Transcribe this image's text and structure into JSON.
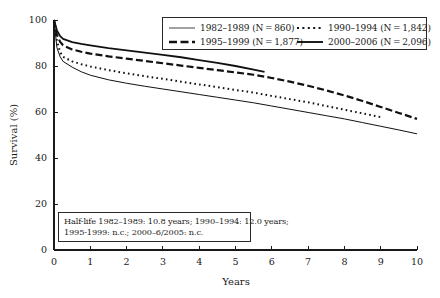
{
  "chart_data": {
    "type": "line",
    "title": "",
    "xlabel": "Years",
    "ylabel": "Survival (%)",
    "xlim": [
      0,
      10
    ],
    "ylim": [
      0,
      100
    ],
    "grid": false,
    "legend_position": "top-right",
    "x_ticks": [
      "0",
      "1",
      "2",
      "3",
      "4",
      "5",
      "6",
      "7",
      "8",
      "9",
      "10"
    ],
    "y_ticks": [
      "0",
      "20",
      "40",
      "60",
      "80",
      "100"
    ],
    "series": [
      {
        "name": "1982-1989 (N = 860)",
        "label": "1982–1989 (N = 860)",
        "style": "thin-solid",
        "color": "#555555",
        "x": [
          0,
          0.08,
          0.17,
          0.25,
          0.5,
          0.75,
          1,
          1.5,
          2,
          2.5,
          3,
          3.5,
          4,
          4.5,
          5,
          5.5,
          6,
          6.5,
          7,
          7.5,
          8,
          8.5,
          9,
          9.5,
          10
        ],
        "values": [
          100,
          88,
          84,
          82,
          79.5,
          77.5,
          76,
          74,
          72.5,
          71.2,
          70,
          68.8,
          67.6,
          66.4,
          65.2,
          64,
          62.6,
          61.2,
          59.8,
          58.4,
          57,
          55.4,
          53.8,
          52.2,
          50.5
        ]
      },
      {
        "name": "1990-1994 (N = 1,842)",
        "label": "1990–1994 (N = 1,842)",
        "style": "dotted",
        "color": "#111111",
        "x": [
          0,
          0.08,
          0.17,
          0.25,
          0.5,
          0.75,
          1,
          1.5,
          2,
          2.5,
          3,
          3.5,
          4,
          4.5,
          5,
          5.5,
          6,
          6.5,
          7,
          7.5,
          8,
          8.5,
          9
        ],
        "values": [
          100,
          91,
          86,
          84,
          82,
          80.8,
          79.8,
          78.2,
          76.8,
          75.6,
          74.4,
          73.2,
          72,
          70.8,
          69.6,
          68.4,
          67,
          65.6,
          64.2,
          62.6,
          61,
          59.4,
          57.8
        ]
      },
      {
        "name": "1995-1999 (N = 1,877)",
        "label": "1995–1999 (N = 1,877)",
        "style": "dashed",
        "color": "#111111",
        "x": [
          0,
          0.08,
          0.17,
          0.25,
          0.5,
          0.75,
          1,
          1.5,
          2,
          2.5,
          3,
          3.5,
          4,
          4.5,
          5,
          5.5,
          6,
          6.5,
          7,
          7.5,
          8,
          8.5,
          9,
          9.5,
          10
        ],
        "values": [
          100,
          93.5,
          90.5,
          89,
          87.2,
          86.2,
          85.4,
          84.2,
          83.2,
          82.2,
          81.2,
          80.2,
          79.2,
          78.2,
          77.2,
          76.2,
          74.8,
          73.2,
          71.4,
          69.4,
          67.2,
          64.8,
          62.2,
          59.6,
          57
        ]
      },
      {
        "name": "2000-2006 (N = 2,096)",
        "label": "2000–2006 (N = 2,096)",
        "style": "thick-solid",
        "color": "#111111",
        "x": [
          0,
          0.08,
          0.17,
          0.25,
          0.5,
          0.75,
          1,
          1.5,
          2,
          2.5,
          3,
          3.5,
          4,
          4.5,
          5,
          5.5,
          5.8
        ],
        "values": [
          100,
          95.5,
          93,
          91.8,
          90.4,
          89.6,
          89,
          87.8,
          86.8,
          85.8,
          84.8,
          83.8,
          82.6,
          81.4,
          80,
          78.4,
          77.4
        ]
      }
    ],
    "annotation": {
      "line1": "Half-life 1982–1989: 10.8 years; 1990–1994: 12.0 years;",
      "line2": "1995-1999: n.c.; 2000–6/2005: n.c."
    }
  }
}
